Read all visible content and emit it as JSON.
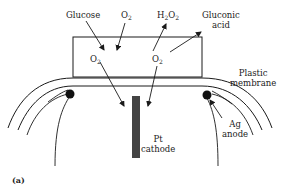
{
  "figure": {
    "panel_label": "(a)",
    "labels": {
      "glucose": "Glucose",
      "o2_in_top": "O",
      "o2_in_top_sub": "2",
      "h2o2": "H",
      "h2o2_sub1": "2",
      "h2o2_mid": "O",
      "h2o2_sub2": "2",
      "gluconic_line1": "Gluconic",
      "gluconic_line2": "acid",
      "o2_left": "O",
      "o2_left_sub": "2",
      "o2_right": "O",
      "o2_right_sub": "2",
      "membrane_line1": "Plastic",
      "membrane_line2": "membrane",
      "cathode_line1": "Pt",
      "cathode_line2": "cathode",
      "anode_line1": "Ag",
      "anode_line2": "anode"
    },
    "colors": {
      "line": "#1a1a1a",
      "cathode": "#444444",
      "anode": "#111111",
      "background": "#ffffff"
    }
  }
}
